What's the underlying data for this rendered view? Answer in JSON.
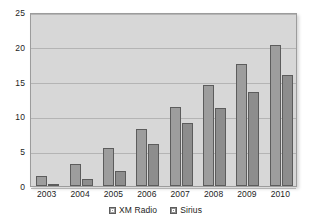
{
  "chart_data": {
    "type": "bar",
    "title": "",
    "subtitle": "",
    "xlabel": "",
    "ylabel": "",
    "categories": [
      "2003",
      "2004",
      "2005",
      "2006",
      "2007",
      "2008",
      "2009",
      "2010"
    ],
    "series": [
      {
        "name": "XM Radio",
        "values": [
          1.4,
          3.1,
          5.4,
          8.2,
          11.3,
          14.5,
          17.5,
          20.2
        ],
        "color": "#9d9d9d"
      },
      {
        "name": "Sirius",
        "values": [
          0.3,
          1.0,
          2.2,
          6.0,
          9.0,
          11.2,
          13.5,
          16.0
        ],
        "color": "#8d8d8d"
      }
    ],
    "ylim": [
      0,
      25
    ],
    "yticks": [
      0,
      5,
      10,
      15,
      20,
      25
    ],
    "ytick_labels": [
      "0",
      "5",
      "10",
      "15",
      "20",
      "25"
    ],
    "grid": true,
    "legend_position": "bottom",
    "plot_background": "#d7d7d7",
    "gridline_color": "#b4b4b4",
    "axis_text_color": "#1d1d1d"
  }
}
